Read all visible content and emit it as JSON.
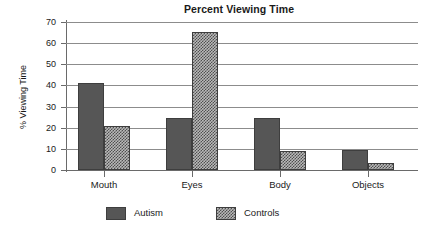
{
  "chart_data": {
    "type": "bar",
    "title": "Percent Viewing Time",
    "xlabel": "",
    "ylabel": "% Viewing Time",
    "categories": [
      "Mouth",
      "Eyes",
      "Body",
      "Objects"
    ],
    "series": [
      {
        "name": "Autism",
        "color": "#565656",
        "pattern": "solid",
        "values": [
          41,
          24.5,
          24.5,
          9.5
        ]
      },
      {
        "name": "Controls",
        "color": "#4f4f4f",
        "pattern": "checkered",
        "values": [
          21,
          65.5,
          9,
          3.5
        ]
      }
    ],
    "ylim": [
      0,
      70
    ],
    "ytick_labels": [
      "70",
      "60",
      "50",
      "40",
      "30",
      "20",
      "10",
      "0"
    ],
    "ytick_values": [
      70,
      60,
      50,
      40,
      30,
      20,
      10,
      0
    ],
    "grid": true,
    "legend_position": "bottom",
    "legend": [
      "Autism",
      "Controls"
    ]
  }
}
